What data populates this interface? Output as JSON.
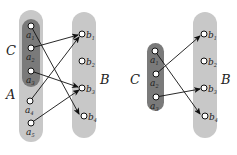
{
  "colors": {
    "set_light": "#c8c8c8",
    "set_dark": "#7a7a7a",
    "node_fill": "#ffffff",
    "node_stroke": "#111111",
    "edge": "#111111"
  },
  "left_diagram": {
    "set_labels": {
      "C": "C",
      "A": "A",
      "B": "B"
    },
    "A_nodes": [
      {
        "id": "a1",
        "label": "a",
        "sub": "1"
      },
      {
        "id": "a2",
        "label": "a",
        "sub": "2"
      },
      {
        "id": "a3",
        "label": "a",
        "sub": "3"
      },
      {
        "id": "a4",
        "label": "a",
        "sub": "4"
      },
      {
        "id": "a5",
        "label": "a",
        "sub": "5"
      }
    ],
    "C_members": [
      "a1",
      "a2",
      "a3"
    ],
    "B_nodes": [
      {
        "id": "b1",
        "label": "b",
        "sub": "1"
      },
      {
        "id": "b2",
        "label": "b",
        "sub": "2"
      },
      {
        "id": "b3",
        "label": "b",
        "sub": "3"
      },
      {
        "id": "b4",
        "label": "b",
        "sub": "4"
      }
    ],
    "edges": [
      {
        "from": "a1",
        "to": "b4"
      },
      {
        "from": "a2",
        "to": "b1"
      },
      {
        "from": "a3",
        "to": "b3"
      },
      {
        "from": "a4",
        "to": "b1"
      },
      {
        "from": "a5",
        "to": "b3"
      }
    ]
  },
  "right_diagram": {
    "set_labels": {
      "C": "C",
      "B": "B"
    },
    "C_nodes": [
      {
        "id": "a1",
        "label": "a",
        "sub": "1"
      },
      {
        "id": "a2",
        "label": "a",
        "sub": "2"
      },
      {
        "id": "a3",
        "label": "a",
        "sub": "3"
      }
    ],
    "B_nodes": [
      {
        "id": "b1",
        "label": "b",
        "sub": "1"
      },
      {
        "id": "b2",
        "label": "b",
        "sub": "2"
      },
      {
        "id": "b3",
        "label": "b",
        "sub": "3"
      },
      {
        "id": "b4",
        "label": "b",
        "sub": "4"
      }
    ],
    "edges": [
      {
        "from": "a1",
        "to": "b4"
      },
      {
        "from": "a2",
        "to": "b1"
      },
      {
        "from": "a3",
        "to": "b3"
      }
    ]
  }
}
